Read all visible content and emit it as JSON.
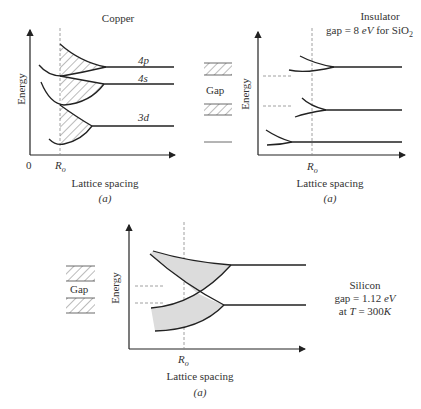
{
  "panels": {
    "copper": {
      "title": "Copper",
      "ylabel": "Energy",
      "xlabel": "Lattice spacing",
      "origin": "0",
      "ro": "R",
      "ro_sub": "o",
      "caption": "(a)",
      "bands": [
        "4p",
        "4s",
        "3d"
      ]
    },
    "insulator": {
      "title": "Insulator",
      "subtitle": "gap = 8 eV for SiO2",
      "ylabel": "Energy",
      "xlabel": "Lattice spacing",
      "ro": "R",
      "ro_sub": "o",
      "caption": "(a)",
      "gap_label": "Gap"
    },
    "silicon": {
      "title": "Silicon",
      "line2": "gap = 1.12 eV",
      "line3": "at T = 300K",
      "ylabel": "Energy",
      "xlabel": "Lattice spacing",
      "ro": "R",
      "ro_sub": "o",
      "caption": "(a)",
      "gap_label": "Gap"
    }
  },
  "colors": {
    "line": "#222222",
    "fill": "#dcdcdc",
    "dash": "#888888"
  }
}
